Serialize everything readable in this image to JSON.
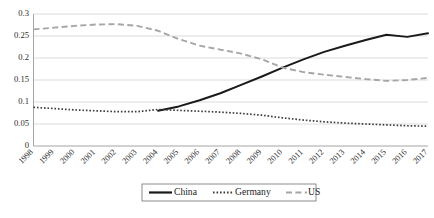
{
  "chart_data": {
    "type": "line",
    "title": "",
    "xlabel": "",
    "ylabel": "",
    "grid": true,
    "legend_position": "bottom",
    "ylim": [
      0,
      0.3
    ],
    "ytick_labels": [
      "0.3",
      "0.25",
      "0.2",
      "0.15",
      "0.1",
      "0.05",
      "0"
    ],
    "ytick_values": [
      0.3,
      0.25,
      0.2,
      0.15,
      0.1,
      0.05,
      0
    ],
    "categories": [
      "1998",
      "1999",
      "2000",
      "2001",
      "2002",
      "2003",
      "2004",
      "2005",
      "2006",
      "2007",
      "2008",
      "2009",
      "2010",
      "2011",
      "2012",
      "2013",
      "2014",
      "2015",
      "2016",
      "2017"
    ],
    "x": [
      1998,
      1999,
      2000,
      2001,
      2002,
      2003,
      2004,
      2005,
      2006,
      2007,
      2008,
      2009,
      2010,
      2011,
      2012,
      2013,
      2014,
      2015,
      2016,
      2017
    ],
    "series": [
      {
        "name": "China",
        "style": "solid",
        "color": "#1a1a1a",
        "values": [
          null,
          null,
          null,
          null,
          null,
          null,
          0.08,
          0.09,
          0.104,
          0.12,
          0.139,
          0.158,
          0.178,
          0.197,
          0.214,
          0.228,
          0.241,
          0.253,
          0.248,
          0.256
        ]
      },
      {
        "name": "Germany",
        "style": "dotted",
        "color": "#3d3d3d",
        "values": [
          0.088,
          0.085,
          0.082,
          0.08,
          0.078,
          0.078,
          0.083,
          0.081,
          0.079,
          0.077,
          0.074,
          0.07,
          0.064,
          0.059,
          0.055,
          0.052,
          0.05,
          0.048,
          0.046,
          0.045
        ]
      },
      {
        "name": "US",
        "style": "dashed",
        "color": "#a6a6a6",
        "values": [
          0.265,
          0.269,
          0.273,
          0.276,
          0.277,
          0.273,
          0.262,
          0.243,
          0.228,
          0.219,
          0.21,
          0.197,
          0.178,
          0.168,
          0.162,
          0.157,
          0.152,
          0.148,
          0.15,
          0.155
        ]
      }
    ],
    "legend": [
      {
        "label": "China",
        "style": "solid",
        "color": "#1a1a1a"
      },
      {
        "label": "Germany",
        "style": "dotted",
        "color": "#3d3d3d"
      },
      {
        "label": "US",
        "style": "dashed",
        "color": "#a6a6a6"
      }
    ]
  },
  "caption": {
    "text": ""
  }
}
